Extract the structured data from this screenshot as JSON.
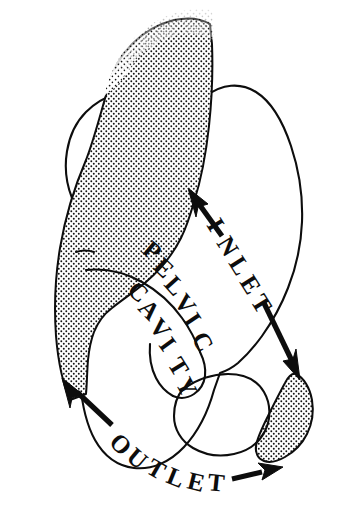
{
  "figure": {
    "background_color": "#ffffff",
    "ink_color": "#0d0d0d",
    "width": 348,
    "height": 528
  },
  "labels": {
    "inlet": {
      "text": "INLET",
      "characters": [
        "I",
        "N",
        "L",
        "E",
        "T"
      ],
      "orientation": "rotated-diagonal-down-right",
      "rotation_deg": 58
    },
    "pelvic": {
      "text": "PELVIC",
      "characters": [
        "P",
        "E",
        "L",
        "V",
        "I",
        "C"
      ],
      "orientation": "curved-arc-down-right",
      "rotation_deg": 48
    },
    "cavity": {
      "text": "CAVITY",
      "characters": [
        "C",
        "A",
        "V",
        "I",
        "T",
        "Y"
      ],
      "orientation": "curved-arc-down-right",
      "rotation_deg": 52
    },
    "outlet": {
      "text": "OUTLET",
      "characters": [
        "O",
        "U",
        "T",
        "L",
        "E",
        "T"
      ],
      "orientation": "curved-arc-down-right",
      "rotation_deg": 40
    }
  },
  "annotations": {
    "inlet_arrow_upper": {
      "name": "inlet-arrow-upper-left",
      "points_to": "sacral-promontory",
      "direction": "up-left"
    },
    "inlet_arrow_lower": {
      "name": "inlet-arrow-lower-right",
      "points_to": "pubic-symphysis-coccyx",
      "direction": "down-right"
    },
    "outlet_arrow_left": {
      "name": "outlet-arrow-left",
      "points_to": "ischial-tuberosity",
      "direction": "up-left"
    },
    "outlet_arrow_right": {
      "name": "outlet-arrow-right",
      "points_to": "coccyx-tip",
      "direction": "right"
    }
  },
  "regions": {
    "sacrum": {
      "name": "sacrum",
      "fill": "stipple",
      "description": "large stippled wedge upper-left"
    },
    "coccyx": {
      "name": "coccyx",
      "fill": "stipple",
      "description": "small stippled oval lower-right"
    },
    "hip_bone": {
      "name": "hip-bone",
      "fill": "white",
      "description": "outlined innominate bone"
    },
    "obturator_foramen": {
      "name": "obturator-foramen",
      "fill": "white",
      "description": "closed loop in lower centre"
    }
  }
}
